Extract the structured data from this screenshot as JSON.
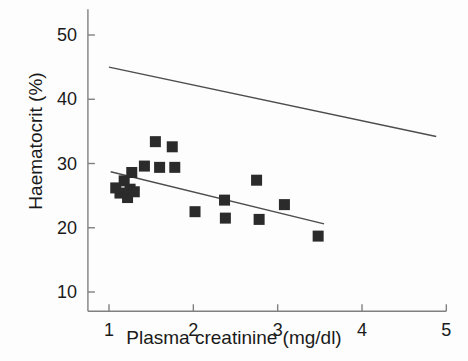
{
  "chart_data": {
    "type": "scatter",
    "title": "",
    "xlabel": "Plasma creatinine (mg/dl)",
    "ylabel": "Haematocrit (%)",
    "xlim": [
      0.75,
      5.0
    ],
    "ylim": [
      7.0,
      54.0
    ],
    "xticks": [
      1,
      2,
      3,
      4,
      5
    ],
    "xtick_labels": [
      "1",
      "2",
      "3",
      "4",
      "5"
    ],
    "yticks": [
      10,
      20,
      30,
      40,
      50
    ],
    "ytick_labels": [
      "10",
      "20",
      "30",
      "40",
      "50"
    ],
    "grid": false,
    "legend": null,
    "marker": "square",
    "marker_color": "#2b2b2b",
    "axis_color": "#808080",
    "points": [
      {
        "x": 1.08,
        "y": 26.2
      },
      {
        "x": 1.13,
        "y": 25.4
      },
      {
        "x": 1.18,
        "y": 27.3
      },
      {
        "x": 1.22,
        "y": 24.7
      },
      {
        "x": 1.25,
        "y": 26.0
      },
      {
        "x": 1.27,
        "y": 28.6
      },
      {
        "x": 1.3,
        "y": 25.6
      },
      {
        "x": 1.42,
        "y": 29.6
      },
      {
        "x": 1.55,
        "y": 33.4
      },
      {
        "x": 1.6,
        "y": 29.4
      },
      {
        "x": 1.75,
        "y": 32.6
      },
      {
        "x": 1.78,
        "y": 29.4
      },
      {
        "x": 2.02,
        "y": 22.5
      },
      {
        "x": 2.37,
        "y": 24.3
      },
      {
        "x": 2.38,
        "y": 21.5
      },
      {
        "x": 2.75,
        "y": 27.4
      },
      {
        "x": 2.78,
        "y": 21.3
      },
      {
        "x": 3.08,
        "y": 23.6
      },
      {
        "x": 3.48,
        "y": 18.7
      }
    ],
    "lines": [
      {
        "name": "upper-reference-line",
        "x1": 1.0,
        "y1": 45.0,
        "x2": 4.88,
        "y2": 34.2
      },
      {
        "name": "regression-line",
        "x1": 1.02,
        "y1": 28.7,
        "x2": 3.55,
        "y2": 20.6
      }
    ]
  }
}
